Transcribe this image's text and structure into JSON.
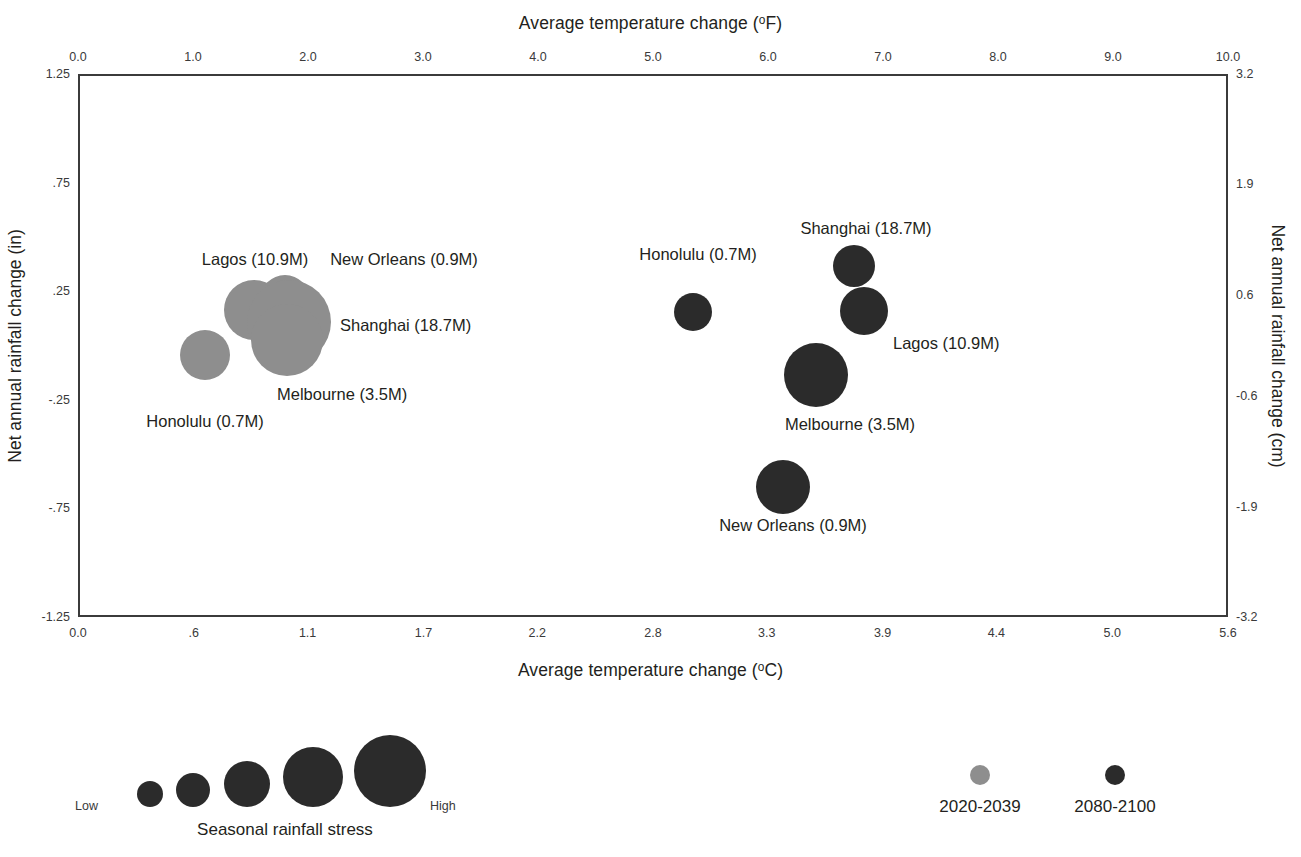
{
  "chart_data": {
    "type": "scatter",
    "subtype": "bubble",
    "title": "",
    "xlabel": "Average temperature change (°C)",
    "xlabel_top": "Average temperature change (°F)",
    "ylabel": "Net annual rainfall change (in)",
    "ylabel_right": "Net annual rainfall change (cm)",
    "grid": false,
    "legend_position": "bottom",
    "axes": {
      "x_bottom": {
        "label": "Average temperature change (°C)",
        "unit": "°C",
        "ticks": [
          "0.0",
          ".6",
          "1.1",
          "1.7",
          "2.2",
          "2.8",
          "3.3",
          "3.9",
          "4.4",
          "5.0",
          "5.6"
        ],
        "values": [
          0.0,
          0.56,
          1.11,
          1.67,
          2.22,
          2.78,
          3.33,
          3.89,
          4.44,
          5.0,
          5.56
        ],
        "xlim": [
          0.0,
          5.56
        ]
      },
      "x_top": {
        "label": "Average temperature change (°F)",
        "unit": "°F",
        "ticks": [
          "0.0",
          "1.0",
          "2.0",
          "3.0",
          "4.0",
          "5.0",
          "6.0",
          "7.0",
          "8.0",
          "9.0",
          "10.0"
        ],
        "values": [
          0,
          1,
          2,
          3,
          4,
          5,
          6,
          7,
          8,
          9,
          10
        ],
        "xlim": [
          0,
          10
        ]
      },
      "y_left": {
        "label": "Net annual rainfall change (in)",
        "unit": "in",
        "ticks": [
          "1.25",
          ".75",
          ".25",
          "-.25",
          "-.75",
          "-1.25"
        ],
        "values": [
          1.25,
          0.75,
          0.25,
          -0.25,
          -0.75,
          -1.25
        ],
        "ylim": [
          -1.25,
          1.25
        ]
      },
      "y_right": {
        "label": "Net annual rainfall change (cm)",
        "unit": "cm",
        "ticks": [
          "3.2",
          "1.9",
          "0.6",
          "-0.6",
          "-1.9",
          "-3.2"
        ],
        "values": [
          3.2,
          1.9,
          0.6,
          -0.6,
          -1.9,
          -3.2
        ],
        "ylim": [
          -3.2,
          3.2
        ]
      }
    },
    "series": [
      {
        "name": "2020-2039",
        "color": "#8e8e8e",
        "points": [
          {
            "city": "Lagos",
            "population": "10.9M",
            "label": "Lagos (10.9M)",
            "x_f": 1.17,
            "x_c": 0.65,
            "y_in": 0.22,
            "y_cm": 0.56,
            "size_radius_px": 30,
            "px": {
              "cx": 254,
              "cy": 310,
              "r": 30
            },
            "label_px": {
              "x": 255,
              "y": 250,
              "anchor": "center"
            }
          },
          {
            "city": "New Orleans",
            "population": "0.9M",
            "label": "New Orleans (0.9M)",
            "x_f": 1.62,
            "x_c": 0.9,
            "y_in": 0.26,
            "y_cm": 0.67,
            "size_radius_px": 25,
            "px": {
              "cx": 285,
              "cy": 300,
              "r": 25
            },
            "label_px": {
              "x": 404,
              "y": 250,
              "anchor": "center"
            }
          },
          {
            "city": "Shanghai",
            "population": "18.7M",
            "label": "Shanghai (18.7M)",
            "x_f": 1.7,
            "x_c": 0.95,
            "y_in": 0.13,
            "y_cm": 0.33,
            "size_radius_px": 42,
            "px": {
              "cx": 289,
              "cy": 322,
              "r": 42
            },
            "label_px": {
              "x": 340,
              "y": 316,
              "anchor": "start"
            }
          },
          {
            "city": "Melbourne",
            "population": "3.5M",
            "label": "Melbourne (3.5M)",
            "x_f": 1.68,
            "x_c": 0.93,
            "y_in": 0.04,
            "y_cm": 0.1,
            "size_radius_px": 36,
            "px": {
              "cx": 287,
              "cy": 340,
              "r": 36
            },
            "label_px": {
              "x": 277,
              "y": 385,
              "anchor": "start"
            }
          },
          {
            "city": "Honolulu",
            "population": "0.7M",
            "label": "Honolulu (0.7M)",
            "x_f": 1.09,
            "x_c": 0.61,
            "y_in": -0.17,
            "y_cm": -0.43,
            "size_radius_px": 25,
            "px": {
              "cx": 205,
              "cy": 355,
              "r": 25
            },
            "label_px": {
              "x": 205,
              "y": 412,
              "anchor": "center"
            }
          }
        ]
      },
      {
        "name": "2080-2100",
        "color": "#2b2b2b",
        "points": [
          {
            "city": "Shanghai",
            "population": "18.7M",
            "label": "Shanghai (18.7M)",
            "x_f": 6.75,
            "x_c": 3.75,
            "y_in": 0.35,
            "y_cm": 0.9,
            "size_radius_px": 21,
            "px": {
              "cx": 854,
              "cy": 266,
              "r": 21
            },
            "label_px": {
              "x": 866,
              "y": 219,
              "anchor": "center"
            }
          },
          {
            "city": "Honolulu",
            "population": "0.7M",
            "label": "Honolulu (0.7M)",
            "x_f": 5.35,
            "x_c": 2.97,
            "y_in": 0.15,
            "y_cm": 0.38,
            "size_radius_px": 19,
            "px": {
              "cx": 693,
              "cy": 312,
              "r": 19
            },
            "label_px": {
              "x": 698,
              "y": 245,
              "anchor": "center"
            }
          },
          {
            "city": "Lagos",
            "population": "10.9M",
            "label": "Lagos (10.9M)",
            "x_f": 6.84,
            "x_c": 3.8,
            "y_in": 0.14,
            "y_cm": 0.37,
            "size_radius_px": 24,
            "px": {
              "cx": 864,
              "cy": 311,
              "r": 24
            },
            "label_px": {
              "x": 893,
              "y": 334,
              "anchor": "start"
            }
          },
          {
            "city": "Melbourne",
            "population": "3.5M",
            "label": "Melbourne (3.5M)",
            "x_f": 6.41,
            "x_c": 3.56,
            "y_in": -0.04,
            "y_cm": -0.11,
            "size_radius_px": 32,
            "px": {
              "cx": 816,
              "cy": 375,
              "r": 32
            },
            "label_px": {
              "x": 850,
              "y": 415,
              "anchor": "center"
            }
          },
          {
            "city": "New Orleans",
            "population": "0.9M",
            "label": "New Orleans (0.9M)",
            "x_f": 6.05,
            "x_c": 3.36,
            "y_in": -0.68,
            "y_cm": -1.74,
            "size_radius_px": 27,
            "px": {
              "cx": 783,
              "cy": 487,
              "r": 27
            },
            "label_px": {
              "x": 793,
              "y": 516,
              "anchor": "center"
            }
          }
        ]
      }
    ],
    "size_legend": {
      "caption": "Seasonal rainfall stress",
      "low_label": "Low",
      "high_label": "High",
      "bubbles": [
        {
          "r": 13,
          "cx": 75
        },
        {
          "r": 17,
          "cx": 118
        },
        {
          "r": 23,
          "cx": 172
        },
        {
          "r": 30,
          "cx": 238
        },
        {
          "r": 36,
          "cx": 315
        }
      ]
    },
    "color_legend": [
      {
        "name": "2020-2039",
        "color": "#8e8e8e",
        "cx": 40
      },
      {
        "name": "2080-2100",
        "color": "#2b2b2b",
        "cx": 175
      }
    ]
  },
  "colors": {
    "early_period": "#8e8e8e",
    "late_period": "#2b2b2b",
    "frame": "#3b3b3b",
    "text": "#231f20",
    "tick_text": "#3a3a3a",
    "background": "#ffffff"
  }
}
